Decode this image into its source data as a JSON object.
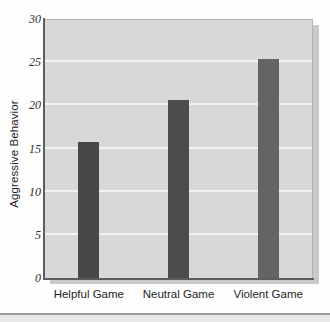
{
  "chart_data": {
    "type": "bar",
    "title": "",
    "subtitle": "",
    "xlabel": "",
    "ylabel": "Aggressive Behavior",
    "categories": [
      "Helpful Game",
      "Neutral Game",
      "Violent Game"
    ],
    "values": [
      15.7,
      20.6,
      25.4
    ],
    "ylim": [
      0,
      30
    ],
    "yticks": [
      "0",
      "5",
      "10",
      "15",
      "20",
      "25",
      "30"
    ],
    "ytick_values": [
      0,
      5,
      10,
      15,
      20,
      25,
      30
    ],
    "grid": "horizontal",
    "legend": "none",
    "annotations": [],
    "series": [
      {
        "name": "Aggressive Behavior",
        "values": [
          15.7,
          20.6,
          25.4
        ]
      }
    ],
    "bar_colors": [
      "#484848",
      "#4c4c4c",
      "#646464"
    ],
    "plot_background": "#d8d8d8",
    "gridline_color": "#f2f2f2",
    "axis_color": "#5c5c5c"
  },
  "axis": {
    "y_title": "Aggressive Behavior"
  }
}
